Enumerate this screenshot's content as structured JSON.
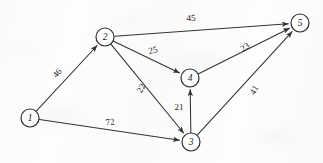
{
  "figure": {
    "kind": "directed-weighted-graph",
    "width": 323,
    "height": 163,
    "background_color": "#fdfdfd",
    "ink_color": "#333333"
  },
  "graph_data": {
    "type": "diagram",
    "directed": true,
    "node_radius": 9,
    "nodes": [
      {
        "id": "1",
        "label": "1",
        "x": 30,
        "y": 118
      },
      {
        "id": "2",
        "label": "2",
        "x": 105,
        "y": 37
      },
      {
        "id": "3",
        "label": "3",
        "x": 191,
        "y": 142
      },
      {
        "id": "4",
        "label": "4",
        "x": 190,
        "y": 78
      },
      {
        "id": "5",
        "label": "5",
        "x": 300,
        "y": 23
      }
    ],
    "edges": [
      {
        "id": "e12",
        "from": "1",
        "to": "2",
        "weight": "46",
        "label_x": 57,
        "label_y": 73,
        "label_rotation": -47
      },
      {
        "id": "e13",
        "from": "1",
        "to": "3",
        "weight": "72",
        "label_x": 110,
        "label_y": 122,
        "label_rotation": -8
      },
      {
        "id": "e25",
        "from": "2",
        "to": "5",
        "weight": "45",
        "label_x": 191,
        "label_y": 18,
        "label_rotation": -4
      },
      {
        "id": "e24",
        "from": "2",
        "to": "4",
        "weight": "25",
        "label_x": 153,
        "label_y": 50,
        "label_rotation": -13
      },
      {
        "id": "e23",
        "from": "2",
        "to": "3",
        "weight": "22",
        "label_x": 141,
        "label_y": 88,
        "label_rotation": -62
      },
      {
        "id": "e34",
        "from": "3",
        "to": "4",
        "weight": "21",
        "label_x": 179,
        "label_y": 107,
        "label_rotation": 0
      },
      {
        "id": "e35",
        "from": "3",
        "to": "5",
        "weight": "41",
        "label_x": 254,
        "label_y": 90,
        "label_rotation": -58
      },
      {
        "id": "e45",
        "from": "4",
        "to": "5",
        "weight": "23",
        "label_x": 245,
        "label_y": 47,
        "label_rotation": -32
      }
    ]
  }
}
